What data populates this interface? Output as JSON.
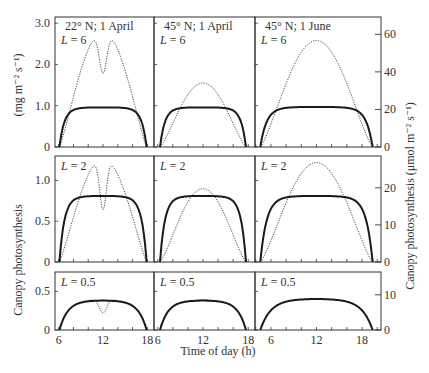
{
  "chart_data": {
    "type": "line",
    "title": "",
    "xlabel": "Time of day (h)",
    "ylabel_left": "Canopy photosynthesis",
    "ylabel_left_unit": "(mg m⁻² s⁻¹)",
    "ylabel_right": "Canopy photosynthesis (μmol m⁻² s⁻¹)",
    "columns": [
      {
        "label": "22° N; 1 April",
        "xlim": [
          5.5,
          18.9
        ],
        "xticks": [
          6,
          12,
          18
        ],
        "sunrise": 6.1,
        "sunset": 17.9
      },
      {
        "label": "45° N; 1 April",
        "xlim": [
          5.5,
          18.9
        ],
        "xticks": [
          6,
          12,
          18
        ],
        "sunrise": 6.3,
        "sunset": 17.7
      },
      {
        "label": "45° N; 1 June",
        "xlim": [
          3.9,
          20.5
        ],
        "xticks": [
          6,
          12,
          18
        ],
        "sunrise": 4.6,
        "sunset": 19.4
      }
    ],
    "rows": [
      {
        "L_label": "L = 6",
        "ylim": [
          0,
          3.15
        ],
        "yticks": [
          0,
          1.0,
          2.0,
          3.0
        ],
        "ytick_labels": [
          "0",
          "1.0",
          "2.0",
          "3.0"
        ],
        "right_ticks": [
          0,
          20,
          40,
          60
        ],
        "right_scale": 0.0455
      },
      {
        "L_label": "L = 2",
        "ylim": [
          0,
          1.3
        ],
        "yticks": [
          0,
          0.5,
          1.0
        ],
        "ytick_labels": [
          "0",
          "0.5",
          "1.0"
        ],
        "right_ticks": [
          0,
          10,
          20
        ],
        "right_scale": 0.0455
      },
      {
        "L_label": "L = 0.5",
        "ylim": [
          0,
          0.75
        ],
        "yticks": [
          0,
          0.5
        ],
        "ytick_labels": [
          "0",
          "0.5"
        ],
        "right_ticks": [
          0,
          10
        ],
        "right_scale": 0.0455
      }
    ],
    "series": [
      {
        "name": "solid (saturating)",
        "style": "solid",
        "plateau": [
          [
            0.96,
            0.96,
            0.97
          ],
          [
            0.81,
            0.81,
            0.81
          ],
          [
            0.38,
            0.38,
            0.4
          ]
        ]
      },
      {
        "name": "dotted (direct-light proportional)",
        "style": "dotted",
        "peak": [
          [
            2.8,
            1.55,
            2.58
          ],
          [
            1.27,
            0.9,
            1.22
          ],
          [
            0.41,
            0.4,
            0.41
          ]
        ],
        "midday_dip": [
          [
            1.78,
            null,
            null
          ],
          [
            0.64,
            null,
            null
          ],
          [
            0.2,
            null,
            null
          ]
        ]
      }
    ]
  }
}
